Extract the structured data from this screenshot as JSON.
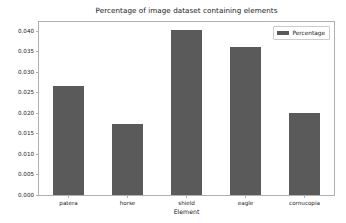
{
  "chart_data": {
    "type": "bar",
    "title": "Percentage of image dataset containing elements",
    "xlabel": "Element",
    "ylabel": "",
    "categories": [
      "patera",
      "horse",
      "shield",
      "eagle",
      "cornucopia"
    ],
    "values": [
      0.0266,
      0.0173,
      0.0402,
      0.0362,
      0.0199
    ],
    "series": [
      {
        "name": "Percentage",
        "values": [
          0.0266,
          0.0173,
          0.0402,
          0.0362,
          0.0199
        ],
        "color": "#5a5a5a"
      }
    ],
    "ylim": [
      0.0,
      0.0422
    ],
    "yticks": [
      0.0,
      0.005,
      0.01,
      0.015,
      0.02,
      0.025,
      0.03,
      0.035,
      0.04
    ],
    "ytick_labels": [
      "0.000",
      "0.005",
      "0.010",
      "0.015",
      "0.020",
      "0.025",
      "0.030",
      "0.035",
      "0.040"
    ],
    "xtick_labels": [
      "patera",
      "horse",
      "shield",
      "eagle",
      "cornucopia"
    ],
    "grid": false,
    "legend": {
      "position": "upper right",
      "entries": [
        {
          "label": "Percentage",
          "color": "#5a5a5a"
        }
      ]
    },
    "bar_width_fraction": 0.52,
    "background_color": "#ffffff",
    "frame_color": "#b0b0b0",
    "text_color": "#1a1a1a"
  }
}
